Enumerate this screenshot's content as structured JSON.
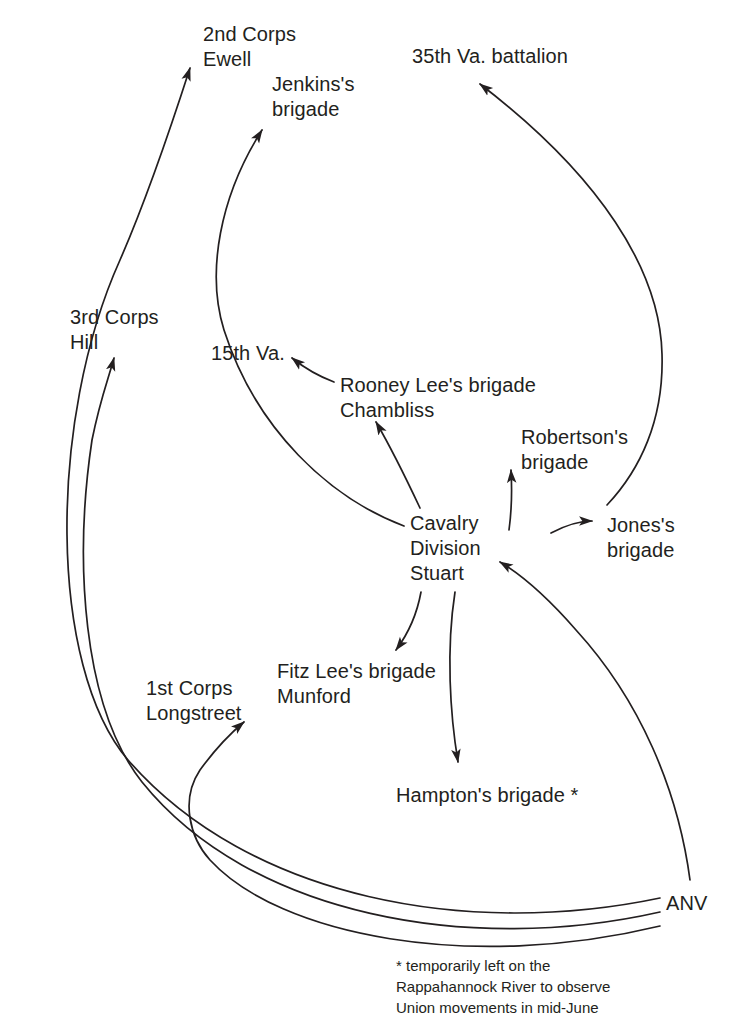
{
  "diagram": {
    "background_color": "#ffffff",
    "line_color": "#231f20",
    "text_color": "#231f20",
    "nodes": [
      {
        "id": "second_corps",
        "lines": [
          "2nd Corps",
          "Ewell"
        ],
        "x": 203,
        "y": 22,
        "align": "left"
      },
      {
        "id": "jenkins",
        "lines": [
          "Jenkins's",
          "brigade"
        ],
        "x": 272,
        "y": 72,
        "align": "left"
      },
      {
        "id": "va35",
        "lines": [
          "35th Va. battalion"
        ],
        "x": 412,
        "y": 44,
        "align": "left"
      },
      {
        "id": "third_corps",
        "lines": [
          "3rd Corps",
          "Hill"
        ],
        "x": 70,
        "y": 305,
        "align": "left"
      },
      {
        "id": "va15",
        "lines": [
          "15th Va."
        ],
        "x": 211,
        "y": 341,
        "align": "left"
      },
      {
        "id": "rooney_lee",
        "lines": [
          "Rooney Lee's brigade",
          "Chambliss"
        ],
        "x": 340,
        "y": 373,
        "align": "left"
      },
      {
        "id": "robertson",
        "lines": [
          "Robertson's",
          "brigade"
        ],
        "x": 521,
        "y": 425,
        "align": "left"
      },
      {
        "id": "cavalry",
        "lines": [
          "Cavalry",
          "Division",
          "Stuart"
        ],
        "x": 410,
        "y": 511,
        "align": "left"
      },
      {
        "id": "jones",
        "lines": [
          "Jones's",
          "brigade"
        ],
        "x": 607,
        "y": 513,
        "align": "left"
      },
      {
        "id": "first_corps",
        "lines": [
          "1st Corps",
          "Longstreet"
        ],
        "x": 146,
        "y": 676,
        "align": "left"
      },
      {
        "id": "fitz_lee",
        "lines": [
          "Fitz Lee's brigade",
          "Munford"
        ],
        "x": 277,
        "y": 659,
        "align": "left"
      },
      {
        "id": "hampton",
        "lines": [
          "Hampton's brigade *"
        ],
        "x": 396,
        "y": 783,
        "align": "left"
      },
      {
        "id": "anv",
        "lines": [
          "ANV"
        ],
        "x": 666,
        "y": 891,
        "align": "left"
      }
    ],
    "footnote": {
      "id": "footnote",
      "lines": [
        "* temporarily left on the",
        "Rappahannock River to observe",
        "Union movements in mid-June"
      ],
      "x": 396,
      "y": 955
    },
    "edges": [
      {
        "id": "anv-to-second-corps",
        "from": "ANV",
        "to": "2nd Corps Ewell",
        "arrow": true,
        "path": "M 660 898 C 470 938 250 900 128 760 C 48 666 48 420 120 260 C 148 196 170 130 190 68"
      },
      {
        "id": "anv-to-third-corps",
        "from": "ANV",
        "to": "3rd Corps Hill",
        "arrow": true,
        "path": "M 660 912 C 470 955 250 916 142 782 C 82 706 74 560 92 440 C 100 400 108 380 114 358"
      },
      {
        "id": "anv-to-first-corps",
        "from": "ANV",
        "to": "1st Corps Longstreet",
        "arrow": true,
        "path": "M 660 926 C 470 972 280 936 210 860 C 190 838 180 800 200 770 C 216 748 232 732 244 722"
      },
      {
        "id": "anv-to-cavalry",
        "from": "ANV",
        "to": "Cavalry Division Stuart",
        "arrow": true,
        "path": "M 690 880 C 678 790 640 700 576 630 C 548 598 520 574 500 562"
      },
      {
        "id": "cavalry-to-jenkins",
        "from": "Cavalry Division",
        "to": "Jenkins's brigade",
        "arrow": true,
        "path": "M 404 526 C 330 498 256 430 224 330 C 206 272 220 196 262 130"
      },
      {
        "id": "cavalry-to-rooney",
        "from": "Cavalry Division",
        "to": "Rooney Lee's brigade",
        "arrow": true,
        "path": "M 420 508 C 404 474 390 446 376 422"
      },
      {
        "id": "rooney-to-15th-va",
        "from": "Rooney Lee's brigade",
        "to": "15th Va.",
        "arrow": true,
        "path": "M 334 382 C 318 376 302 366 292 358"
      },
      {
        "id": "cavalry-to-robertson",
        "from": "Cavalry Division",
        "to": "Robertson's brigade",
        "arrow": true,
        "path": "M 509 530 C 512 508 512 488 511 470"
      },
      {
        "id": "cavalry-to-jones",
        "from": "Cavalry Division",
        "to": "Jones's brigade",
        "arrow": true,
        "path": "M 551 533 C 568 524 580 521 592 521"
      },
      {
        "id": "jones-to-35th-va",
        "from": "Jones's brigade",
        "to": "35th Va. battalion",
        "arrow": true,
        "path": "M 607 505 C 640 470 664 420 662 354 C 660 270 600 176 480 84"
      },
      {
        "id": "cavalry-to-fitz-lee",
        "from": "Cavalry Division",
        "to": "Fitz Lee's brigade",
        "arrow": true,
        "path": "M 421 592 C 417 614 408 634 396 650"
      },
      {
        "id": "cavalry-to-hampton",
        "from": "Cavalry Division",
        "to": "Hampton's brigade",
        "arrow": true,
        "path": "M 455 592 C 446 650 450 714 458 762"
      }
    ]
  }
}
